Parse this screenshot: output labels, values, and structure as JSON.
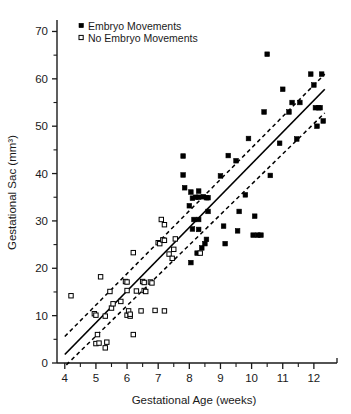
{
  "chart_data": {
    "type": "scatter",
    "title": "",
    "xlabel": "Gestational Age (weeks)",
    "ylabel": "Gestational Sac (mm³)",
    "xlim": [
      3.75,
      12.55
    ],
    "ylim": [
      0,
      72
    ],
    "xticks": [
      4,
      5,
      6,
      7,
      8,
      9,
      10,
      11,
      12
    ],
    "xticklabels": [
      "4",
      "5",
      "6",
      "7",
      "8",
      "9",
      "10",
      "11",
      "12"
    ],
    "xminorticks": [
      4.5,
      5.5,
      6.5,
      7.5,
      8.5,
      9.5,
      10.5,
      11.5
    ],
    "yticks": [
      0,
      10,
      20,
      30,
      40,
      50,
      60,
      70
    ],
    "yticklabels": [
      "0",
      "10",
      "20",
      "30",
      "40",
      "50",
      "60",
      "70"
    ],
    "yminorticks": [
      5,
      15,
      25,
      35,
      45,
      55,
      65
    ],
    "grid": false,
    "legend_position": "top-left",
    "legend": [
      {
        "label": "Embryo Movements",
        "marker": "filled-square",
        "color": "#000000"
      },
      {
        "label": "No Embryo Movements",
        "marker": "open-square",
        "color": "#000000"
      }
    ],
    "series": [
      {
        "name": "Embryo Movements",
        "marker": "filled-square",
        "points": [
          [
            8.05,
            21.2
          ],
          [
            8.1,
            28.3
          ],
          [
            8.15,
            30.3
          ],
          [
            8.3,
            30.3
          ],
          [
            8.3,
            28.2
          ],
          [
            8.25,
            23.2
          ],
          [
            8.4,
            24.3
          ],
          [
            8.5,
            25.2
          ],
          [
            8.55,
            26.1
          ],
          [
            8.6,
            32.0
          ],
          [
            8.1,
            34.8
          ],
          [
            8.2,
            35.0
          ],
          [
            8.3,
            35.0
          ],
          [
            8.45,
            35.1
          ],
          [
            8.6,
            34.9
          ],
          [
            8.0,
            33.2
          ],
          [
            8.05,
            36.1
          ],
          [
            7.85,
            37.0
          ],
          [
            7.8,
            39.7
          ],
          [
            7.8,
            43.7
          ],
          [
            8.3,
            36.3
          ],
          [
            8.55,
            34.9
          ],
          [
            9.0,
            39.5
          ],
          [
            9.15,
            25.2
          ],
          [
            9.1,
            28.9
          ],
          [
            9.25,
            43.8
          ],
          [
            9.5,
            42.7
          ],
          [
            9.55,
            27.9
          ],
          [
            9.6,
            32.0
          ],
          [
            9.9,
            47.4
          ],
          [
            10.1,
            31.0
          ],
          [
            10.05,
            27.0
          ],
          [
            10.2,
            27.0
          ],
          [
            10.3,
            27.0
          ],
          [
            10.4,
            53.0
          ],
          [
            10.5,
            65.2
          ],
          [
            10.6,
            39.6
          ],
          [
            10.9,
            46.4
          ],
          [
            11.0,
            57.8
          ],
          [
            11.2,
            53.0
          ],
          [
            11.3,
            55.0
          ],
          [
            11.55,
            55.0
          ],
          [
            11.45,
            47.3
          ],
          [
            11.9,
            61.0
          ],
          [
            12.0,
            58.7
          ],
          [
            12.05,
            53.9
          ],
          [
            12.15,
            53.9
          ],
          [
            12.2,
            53.9
          ],
          [
            12.25,
            61.0
          ],
          [
            12.3,
            51.1
          ],
          [
            12.1,
            50.0
          ],
          [
            9.8,
            35.5
          ]
        ]
      },
      {
        "name": "No Embryo Movements",
        "marker": "open-square",
        "points": [
          [
            4.2,
            14.2
          ],
          [
            4.95,
            10.4
          ],
          [
            5.0,
            10.1
          ],
          [
            5.05,
            6.0
          ],
          [
            5.0,
            4.1
          ],
          [
            5.1,
            4.2
          ],
          [
            5.15,
            18.2
          ],
          [
            5.3,
            3.2
          ],
          [
            5.35,
            4.4
          ],
          [
            5.3,
            9.9
          ],
          [
            5.45,
            15.1
          ],
          [
            5.5,
            11.6
          ],
          [
            5.55,
            12.5
          ],
          [
            5.8,
            13.0
          ],
          [
            5.95,
            17.2
          ],
          [
            6.0,
            17.1
          ],
          [
            6.0,
            15.3
          ],
          [
            6.0,
            10.1
          ],
          [
            6.05,
            11.0
          ],
          [
            6.1,
            9.9
          ],
          [
            6.1,
            10.3
          ],
          [
            6.2,
            23.3
          ],
          [
            6.2,
            6.0
          ],
          [
            6.3,
            15.2
          ],
          [
            6.45,
            11.0
          ],
          [
            6.5,
            17.2
          ],
          [
            6.55,
            17.0
          ],
          [
            6.55,
            15.3
          ],
          [
            6.6,
            15.1
          ],
          [
            7.0,
            25.4
          ],
          [
            7.05,
            25.2
          ],
          [
            7.1,
            30.3
          ],
          [
            7.15,
            26.0
          ],
          [
            7.2,
            29.2
          ],
          [
            7.2,
            25.9
          ],
          [
            7.35,
            23.0
          ],
          [
            7.45,
            22.1
          ],
          [
            7.5,
            24.0
          ],
          [
            7.55,
            26.2
          ],
          [
            7.2,
            11.0
          ],
          [
            6.9,
            11.1
          ],
          [
            8.35,
            23.2
          ],
          [
            6.75,
            17.1
          ],
          [
            6.8,
            16.9
          ]
        ]
      }
    ],
    "regression_line": {
      "name": "regression",
      "style": "solid",
      "x": [
        4.0,
        12.35
      ],
      "y": [
        1.8,
        57.8
      ]
    },
    "confidence_bands": [
      {
        "name": "upper-confidence-band",
        "style": "dashed",
        "x": [
          4.0,
          12.35
        ],
        "y": [
          5.6,
          61.0
        ]
      },
      {
        "name": "lower-confidence-band",
        "style": "dashed",
        "x": [
          4.05,
          12.35
        ],
        "y": [
          -0.4,
          52.8
        ]
      }
    ]
  }
}
